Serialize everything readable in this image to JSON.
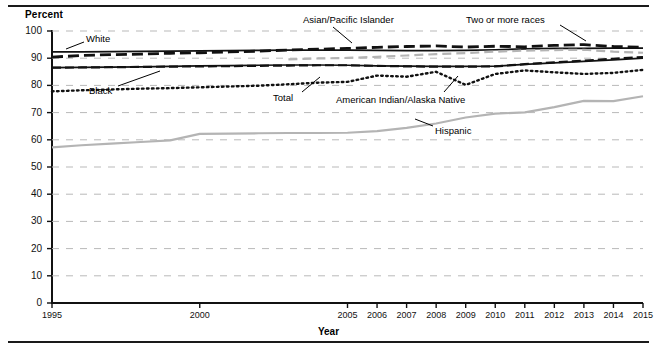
{
  "axes": {
    "ylabel": "Percent",
    "xlabel": "Year",
    "y_ticks": [
      "0",
      "10",
      "20",
      "30",
      "40",
      "50",
      "60",
      "70",
      "80",
      "90",
      "100"
    ],
    "x_ticks": [
      "1995",
      "2000",
      "2005",
      "2006",
      "2007",
      "2008",
      "2009",
      "2010",
      "2011",
      "2012",
      "2013",
      "2014",
      "2015"
    ]
  },
  "annotations": {
    "white": "White",
    "black": "Black",
    "asian": "Asian/Pacific Islander",
    "total": "Total",
    "amind": "American Indian/Alaska Native",
    "tworaces": "Two or more races",
    "hispanic": "Hispanic"
  },
  "colors": {
    "dark": "#111111",
    "gray": "#b4b4b4",
    "grid": "#b9b9b9"
  },
  "chart_data": {
    "type": "line",
    "title": "",
    "xlabel": "Year",
    "ylabel": "Percent",
    "xlim": [
      1995,
      2015
    ],
    "ylim": [
      0,
      100
    ],
    "grid": true,
    "legend": "inline-annotations",
    "x": [
      1995,
      1996,
      1997,
      1998,
      1999,
      2000,
      2001,
      2002,
      2003,
      2004,
      2005,
      2006,
      2007,
      2008,
      2009,
      2010,
      2011,
      2012,
      2013,
      2014,
      2015
    ],
    "series": [
      {
        "name": "Total",
        "style": "solid-black",
        "values": [
          86.5,
          86.6,
          86.7,
          86.8,
          87.0,
          87.2,
          87.3,
          87.4,
          87.5,
          87.5,
          87.4,
          87.2,
          87.1,
          87.0,
          87.0,
          87.1,
          87.7,
          88.3,
          88.8,
          89.4,
          90.0
        ]
      },
      {
        "name": "White",
        "style": "solid-black",
        "values": [
          92.3,
          92.3,
          92.4,
          92.5,
          92.6,
          92.7,
          92.8,
          92.9,
          93.0,
          93.0,
          93.0,
          92.9,
          92.8,
          92.8,
          92.9,
          93.1,
          93.4,
          93.6,
          93.6,
          93.7,
          93.7
        ]
      },
      {
        "name": "Black",
        "style": "dashed-black",
        "values": [
          86.5,
          86.6,
          86.7,
          86.8,
          86.9,
          87.0,
          87.1,
          87.2,
          87.3,
          87.4,
          87.4,
          87.2,
          87.0,
          86.9,
          86.9,
          87.0,
          87.8,
          88.5,
          89.1,
          89.8,
          90.4
        ]
      },
      {
        "name": "Asian/Pacific Islander",
        "style": "dashed-black-thick",
        "values": [
          90.4,
          91.0,
          91.3,
          91.5,
          91.8,
          92.0,
          92.3,
          92.6,
          93.0,
          93.3,
          93.6,
          94.0,
          94.3,
          94.5,
          94.1,
          94.4,
          94.2,
          94.7,
          95.0,
          94.3,
          94.0
        ]
      },
      {
        "name": "American Indian/Alaska Native",
        "style": "dotted-black",
        "values": [
          77.8,
          78.2,
          78.5,
          78.8,
          79.0,
          79.3,
          79.6,
          79.9,
          80.4,
          81.0,
          81.3,
          83.6,
          83.2,
          85.0,
          80.2,
          84.2,
          85.5,
          84.8,
          84.2,
          84.6,
          85.7
        ]
      },
      {
        "name": "Two or more races",
        "style": "dashed-gray",
        "values": [
          null,
          null,
          null,
          null,
          null,
          null,
          null,
          null,
          89.6,
          89.9,
          90.1,
          90.5,
          91.0,
          91.5,
          91.9,
          92.4,
          92.8,
          93.0,
          93.1,
          92.4,
          92.0
        ]
      },
      {
        "name": "Hispanic",
        "style": "solid-gray",
        "values": [
          57.2,
          58.0,
          58.6,
          59.2,
          59.8,
          62.2,
          62.3,
          62.4,
          62.5,
          62.5,
          62.6,
          63.2,
          64.4,
          66.0,
          68.2,
          69.6,
          70.1,
          72.0,
          74.3,
          74.2,
          76.0
        ]
      }
    ]
  }
}
